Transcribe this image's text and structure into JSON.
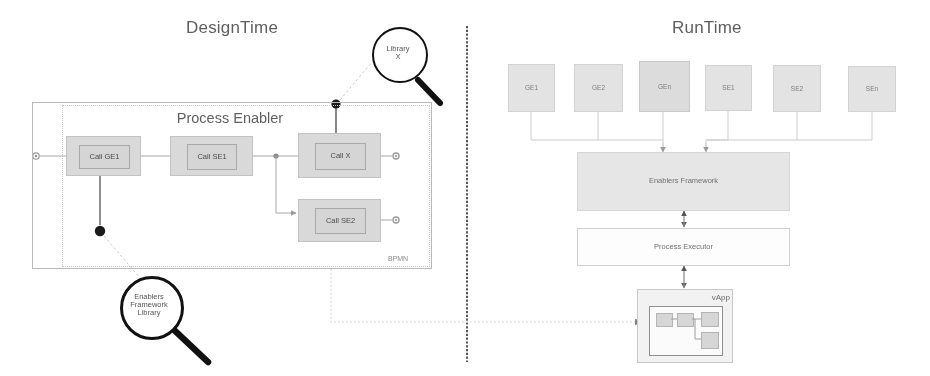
{
  "figure": {
    "sections": {
      "left_title": "DesignTime",
      "right_title": "RunTime"
    },
    "divider": {
      "style": "dashed-vertical"
    }
  },
  "design_time": {
    "process_enabler": {
      "title": "Process Enabler",
      "bpmn_tag": "BPMN",
      "tasks": [
        {
          "label": "Call GE1"
        },
        {
          "label": "Call SE1"
        },
        {
          "label": "Call X"
        },
        {
          "label": "Call SE2"
        }
      ]
    },
    "callouts": [
      {
        "name": "library-x",
        "label": "Library\nX"
      },
      {
        "name": "enablers-framework-library",
        "label": "Enablers\nFramework\nLibrary"
      }
    ]
  },
  "run_time": {
    "generic_enablers": [
      {
        "label": "GE1"
      },
      {
        "label": "GE2"
      },
      {
        "label": "GEn"
      }
    ],
    "specific_enablers": [
      {
        "label": "SE1"
      },
      {
        "label": "SE2"
      },
      {
        "label": "SEn"
      }
    ],
    "enablers_framework": {
      "label": "Enablers Framework"
    },
    "process_executor": {
      "label": "Process Executor"
    },
    "vapp": {
      "label": "vApp"
    }
  },
  "colors": {
    "task_fill": "#d9d9d9",
    "runtime_fill": "#e3e3e3",
    "framework_fill": "#e6e6e6",
    "executor_fill": "#fdfdfd",
    "line": "#b9b9b9",
    "callout_stroke": "#111111",
    "text": "#6e6e6e"
  }
}
